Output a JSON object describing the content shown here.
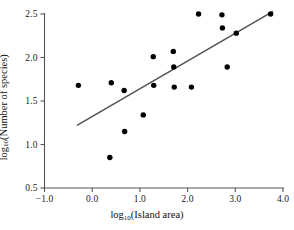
{
  "chart_data": {
    "type": "scatter",
    "title": "",
    "xlabel": "log10(Island area)",
    "ylabel": "log10(Number of species)",
    "xlim": [
      -1.0,
      4.0
    ],
    "ylim": [
      0.5,
      2.5
    ],
    "grid": false,
    "legend": null,
    "xticks": [
      "-1.0",
      "0.0",
      "1.0",
      "2.0",
      "3.0",
      "4.0"
    ],
    "xtick_values": [
      -1.0,
      0.0,
      1.0,
      2.0,
      3.0,
      4.0
    ],
    "yticks": [
      "0.5",
      "1.0",
      "1.5",
      "2.0",
      "2.5"
    ],
    "ytick_values": [
      0.5,
      1.0,
      1.5,
      2.0,
      2.5
    ],
    "point_color": "#000000",
    "line_color": "#555555",
    "axis_color": "#555555",
    "points": [
      {
        "x": -0.29,
        "y": 1.68
      },
      {
        "x": 0.4,
        "y": 1.71
      },
      {
        "x": 0.37,
        "y": 0.85
      },
      {
        "x": 0.67,
        "y": 1.62
      },
      {
        "x": 0.68,
        "y": 1.15
      },
      {
        "x": 1.07,
        "y": 1.34
      },
      {
        "x": 1.28,
        "y": 2.01
      },
      {
        "x": 1.29,
        "y": 1.68
      },
      {
        "x": 1.7,
        "y": 2.07
      },
      {
        "x": 1.71,
        "y": 1.89
      },
      {
        "x": 1.72,
        "y": 1.66
      },
      {
        "x": 2.08,
        "y": 1.66
      },
      {
        "x": 2.23,
        "y": 2.5
      },
      {
        "x": 2.72,
        "y": 2.49
      },
      {
        "x": 2.73,
        "y": 2.34
      },
      {
        "x": 2.83,
        "y": 1.89
      },
      {
        "x": 3.02,
        "y": 2.28
      },
      {
        "x": 3.74,
        "y": 2.5
      }
    ],
    "trendline": {
      "x_start": -0.32,
      "y_start": 1.22,
      "x_end": 3.79,
      "y_end": 2.53
    }
  },
  "axis_titles": {
    "x_prefix": "log",
    "x_sub": "10",
    "x_rest": "(Island area)",
    "y_prefix": "log",
    "y_sub": "10",
    "y_rest": "(Number of species)"
  }
}
